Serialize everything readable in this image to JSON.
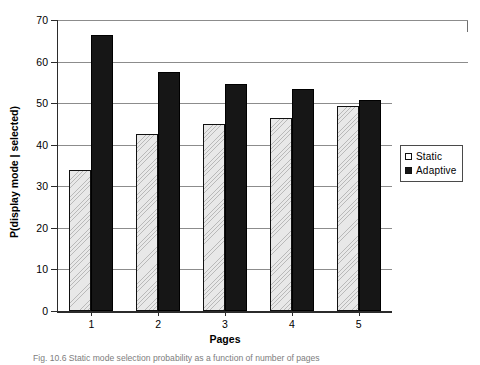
{
  "chart_data": {
    "type": "bar",
    "title": "",
    "xlabel": "Pages",
    "ylabel": "P(display mode | selected)",
    "categories": [
      "1",
      "2",
      "3",
      "4",
      "5"
    ],
    "series": [
      {
        "name": "Static",
        "values": [
          34.0,
          42.5,
          45.0,
          46.5,
          49.3
        ],
        "color": "#e8e8e8",
        "fill": "hatched"
      },
      {
        "name": "Adaptive",
        "values": [
          66.3,
          57.5,
          54.7,
          53.3,
          50.7
        ],
        "color": "#161616",
        "fill": "solid"
      }
    ],
    "ylim": [
      0,
      70
    ],
    "ytick_step": 10,
    "yticks": [
      "0",
      "10",
      "20",
      "30",
      "40",
      "50",
      "60",
      "70"
    ],
    "grid": true,
    "grid_axis": "y",
    "legend_position": "right"
  },
  "legend": {
    "items": [
      {
        "label": "Static"
      },
      {
        "label": "Adaptive"
      }
    ]
  },
  "caption": {
    "text": "Fig. 10.6 Static mode selection probability as a function of number of pages"
  }
}
